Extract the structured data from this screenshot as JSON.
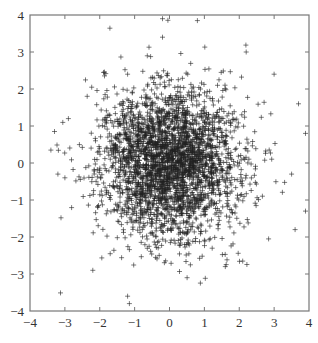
{
  "chart_data": {
    "type": "scatter",
    "title": "",
    "xlabel": "",
    "ylabel": "",
    "xlim": [
      -4,
      4
    ],
    "ylim": [
      -4,
      4
    ],
    "xticks": [
      -4,
      -3,
      -2,
      -1,
      0,
      1,
      2,
      3,
      4
    ],
    "yticks": [
      -4,
      -3,
      -2,
      -1,
      0,
      1,
      2,
      3,
      4
    ],
    "xtick_labels": [
      "−4",
      "−3",
      "−2",
      "−1",
      "0",
      "1",
      "2",
      "3",
      "4"
    ],
    "ytick_labels": [
      "−4",
      "−3",
      "−2",
      "−1",
      "0",
      "1",
      "2",
      "3",
      "4"
    ],
    "grid": false,
    "legend": null,
    "marker": "+",
    "marker_color": "#222222",
    "distribution": {
      "description": "2-D standard normal samples, mean (0,0), std 1 in each dimension",
      "n_points": 3000,
      "mean": [
        0,
        0
      ],
      "std": [
        1,
        1
      ],
      "seed": 7
    },
    "notable_points": [
      {
        "x": -0.2,
        "y": 3.9
      },
      {
        "x": 0.8,
        "y": 3.85
      },
      {
        "x": -0.2,
        "y": 3.4
      },
      {
        "x": -1.2,
        "y": 2.4
      },
      {
        "x": -3.4,
        "y": 0.35
      },
      {
        "x": -2.9,
        "y": 1.2
      },
      {
        "x": -3.2,
        "y": -0.3
      },
      {
        "x": -3.0,
        "y": -0.4
      },
      {
        "x": 3.0,
        "y": 2.4
      },
      {
        "x": 2.2,
        "y": 3.0
      },
      {
        "x": 3.7,
        "y": 1.6
      },
      {
        "x": 3.9,
        "y": 0.8
      },
      {
        "x": 3.5,
        "y": -0.3
      },
      {
        "x": 3.9,
        "y": -1.3
      },
      {
        "x": 3.6,
        "y": -1.8
      },
      {
        "x": -1.2,
        "y": -3.6
      },
      {
        "x": -1.15,
        "y": -3.8
      },
      {
        "x": -2.2,
        "y": -2.9
      },
      {
        "x": 1.6,
        "y": -2.8
      },
      {
        "x": 0.6,
        "y": -2.75
      },
      {
        "x": 2.1,
        "y": -2.65
      },
      {
        "x": -0.4,
        "y": -2.55
      },
      {
        "x": -1.7,
        "y": -2.45
      }
    ]
  },
  "caption": {
    "visible": "partially cut off at bottom edge",
    "text": ""
  }
}
